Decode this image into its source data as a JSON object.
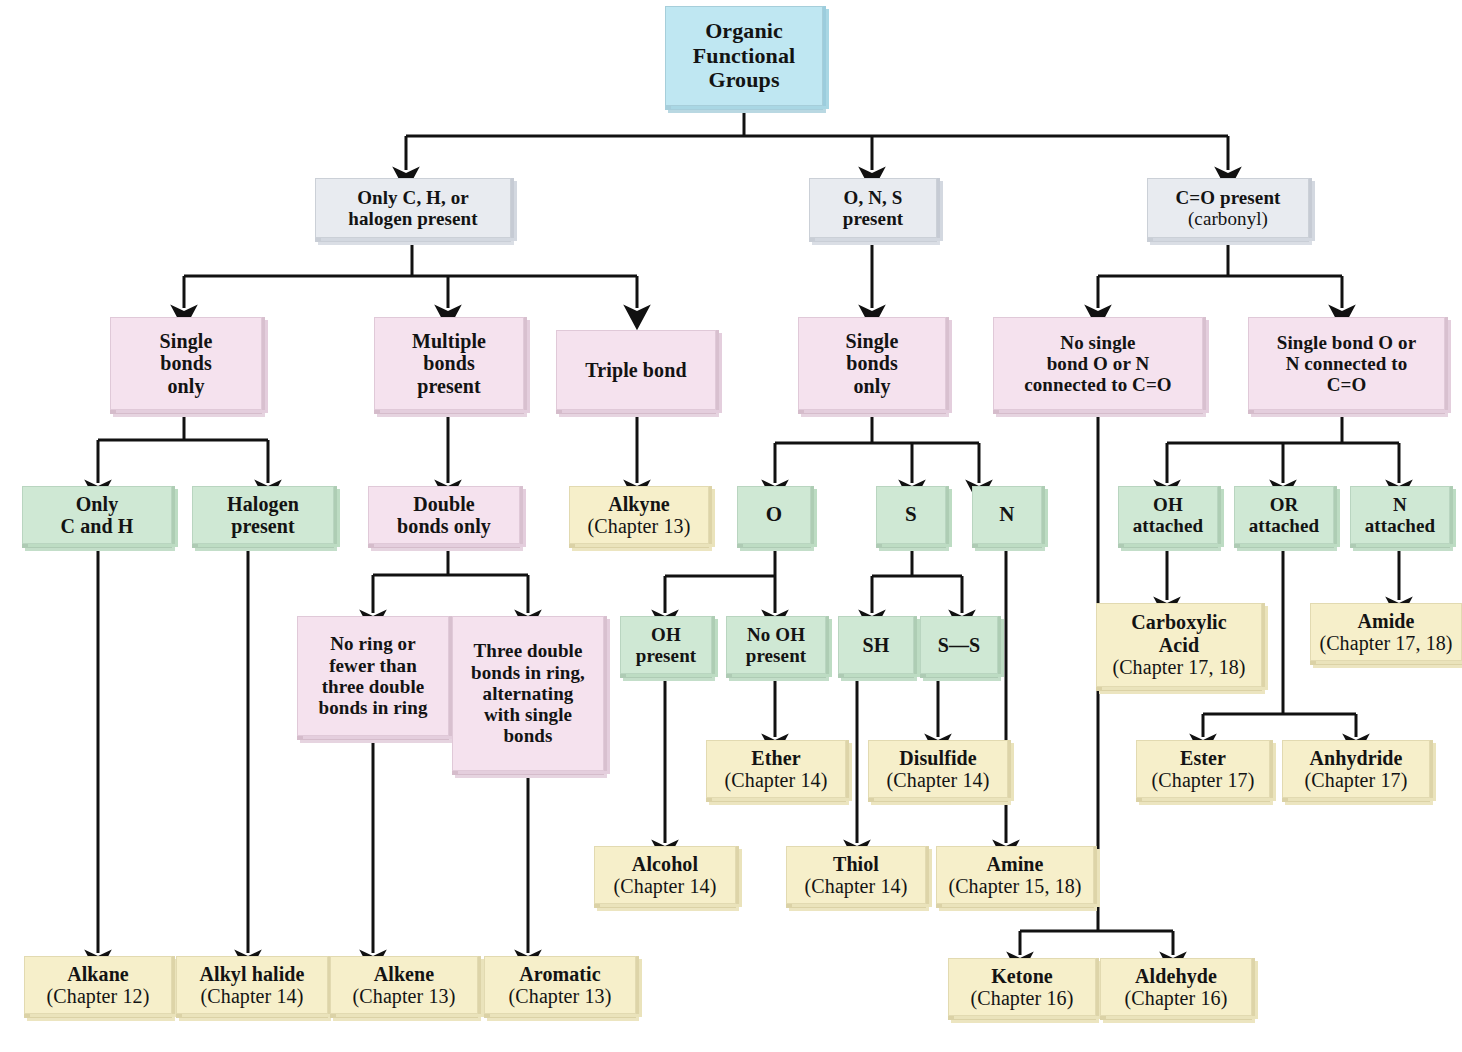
{
  "title": "Organic Functional Groups",
  "colors": {
    "blue": "#bfe7f2",
    "gray": "#e8ebf0",
    "pink": "#f5e2ee",
    "green": "#cfe8d4",
    "yellow": "#f6efca",
    "line": "#111111",
    "text": "#131313"
  },
  "nodes": {
    "root": {
      "line1": "Organic",
      "line2": "Functional",
      "line3": "Groups"
    },
    "ch_halogen": {
      "line1": "Only C, H, or",
      "line2": "halogen present"
    },
    "ons": {
      "line1": "O, N, S",
      "line2": "present"
    },
    "carbonyl": {
      "line1": "C=O present",
      "line2": "(carbonyl)"
    },
    "single_bonds_only_left": {
      "line1": "Single",
      "line2": "bonds",
      "line3": "only"
    },
    "multiple_bonds": {
      "line1": "Multiple",
      "line2": "bonds",
      "line3": "present"
    },
    "triple_bond": {
      "line1": "Triple bond"
    },
    "single_bonds_only_mid": {
      "line1": "Single",
      "line2": "bonds",
      "line3": "only"
    },
    "no_single_bond_on": {
      "line1": "No single",
      "line2": "bond O or N",
      "line3": "connected to C=O"
    },
    "single_bond_on": {
      "line1": "Single bond O or",
      "line2": "N connected to",
      "line3": "C=O"
    },
    "only_c_and_h": {
      "line1": "Only",
      "line2": "C and H"
    },
    "halogen_present": {
      "line1": "Halogen",
      "line2": "present"
    },
    "double_bonds_only": {
      "line1": "Double",
      "line2": "bonds only"
    },
    "alkyne": {
      "name": "Alkyne",
      "chapter": "(Chapter 13)"
    },
    "o_atom": {
      "line1": "O"
    },
    "s_atom": {
      "line1": "S"
    },
    "n_atom": {
      "line1": "N"
    },
    "oh_attached": {
      "line1": "OH",
      "line2": "attached"
    },
    "or_attached": {
      "line1": "OR",
      "line2": "attached"
    },
    "n_attached": {
      "line1": "N",
      "line2": "attached"
    },
    "no_ring": {
      "line1": "No ring or",
      "line2": "fewer than",
      "line3": "three double",
      "line4": "bonds in ring"
    },
    "three_double": {
      "line1": "Three double",
      "line2": "bonds in ring,",
      "line3": "alternating",
      "line4": "with single",
      "line5": "bonds"
    },
    "oh_present": {
      "line1": "OH",
      "line2": "present"
    },
    "no_oh_present": {
      "line1": "No OH",
      "line2": "present"
    },
    "sh": {
      "line1": "SH"
    },
    "ss": {
      "line1": "S—S"
    },
    "carboxylic_acid": {
      "name1": "Carboxylic",
      "name2": "Acid",
      "chapter": "(Chapter 17, 18)"
    },
    "amide": {
      "name": "Amide",
      "chapter": "(Chapter 17, 18)"
    },
    "ether": {
      "name": "Ether",
      "chapter": "(Chapter 14)"
    },
    "disulfide": {
      "name": "Disulfide",
      "chapter": "(Chapter 14)"
    },
    "ester": {
      "name": "Ester",
      "chapter": "(Chapter 17)"
    },
    "anhydride": {
      "name": "Anhydride",
      "chapter": "(Chapter 17)"
    },
    "alcohol": {
      "name": "Alcohol",
      "chapter": "(Chapter 14)"
    },
    "thiol": {
      "name": "Thiol",
      "chapter": "(Chapter 14)"
    },
    "amine": {
      "name": "Amine",
      "chapter": "(Chapter 15, 18)"
    },
    "alkane": {
      "name": "Alkane",
      "chapter": "(Chapter 12)"
    },
    "alkyl_halide": {
      "name": "Alkyl halide",
      "chapter": "(Chapter 14)"
    },
    "alkene": {
      "name": "Alkene",
      "chapter": "(Chapter 13)"
    },
    "aromatic": {
      "name": "Aromatic",
      "chapter": "(Chapter 13)"
    },
    "ketone": {
      "name": "Ketone",
      "chapter": "(Chapter 16)"
    },
    "aldehyde": {
      "name": "Aldehyde",
      "chapter": "(Chapter 16)"
    }
  }
}
